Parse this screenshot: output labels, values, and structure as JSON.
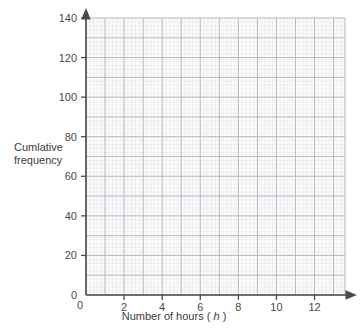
{
  "chart_data": {
    "type": "line",
    "title": "",
    "subtitle": "",
    "series": [],
    "x": [],
    "values": [],
    "xlabel": "Number of hours (h)",
    "xlabel_text": "Number of hours",
    "xlabel_variable": "h",
    "ylabel": "Cumlative frequency",
    "ylabel_line1": "Cumlative",
    "ylabel_line2": "frequency",
    "xlim": [
      0,
      13.6
    ],
    "ylim": [
      0,
      140
    ],
    "x_ticks": [
      0,
      2,
      4,
      6,
      8,
      10,
      12
    ],
    "x_tick_labels": [
      "0",
      "2",
      "4",
      "6",
      "8",
      "10",
      "12"
    ],
    "y_ticks": [
      0,
      20,
      40,
      60,
      80,
      100,
      120,
      140
    ],
    "y_tick_labels": [
      "0",
      "20",
      "40",
      "60",
      "80",
      "100",
      "120",
      "140"
    ],
    "x_major_step": 1,
    "y_major_step": 10,
    "x_minor_per_major": 5,
    "y_minor_per_major": 5,
    "grid": true,
    "legend": false,
    "legend_position": "none",
    "annotations": [],
    "data_points": [],
    "note": "Blank cumulative frequency grid with no plotted data",
    "colors": {
      "background": "#ffffff",
      "plot_background": "#fbfbfc",
      "grid_major": "#b2b6bd",
      "grid_minor": "#e5e7eb",
      "axis": "#4a4a4a",
      "text": "#3c3c3c"
    }
  },
  "axes": {
    "x": {
      "label_text": "Number of hours",
      "label_variable": "h",
      "tick_labels": [
        "0",
        "2",
        "4",
        "6",
        "8",
        "10",
        "12"
      ],
      "arrowhead": true
    },
    "y": {
      "label_line1": "Cumlative",
      "label_line2": "frequency",
      "tick_labels": [
        "0",
        "20",
        "40",
        "60",
        "80",
        "100",
        "120",
        "140"
      ],
      "arrowhead": true
    }
  }
}
